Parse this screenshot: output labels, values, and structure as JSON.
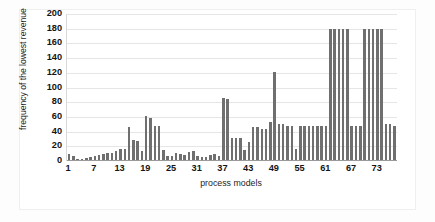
{
  "chart_data": {
    "type": "bar",
    "title": "",
    "xlabel": "process models",
    "ylabel": "frequency of the lowest revenue",
    "ylim": [
      0,
      200
    ],
    "ytick_step": 20,
    "yticks": [
      200,
      180,
      160,
      140,
      120,
      100,
      80,
      60,
      40,
      20,
      0
    ],
    "xticks": [
      1,
      7,
      13,
      19,
      25,
      31,
      37,
      43,
      49,
      55,
      61,
      67,
      73
    ],
    "xlim": [
      1,
      77
    ],
    "grid": true,
    "legend": "none",
    "bar_color": "#6f6f6f",
    "categories": [
      1,
      2,
      3,
      4,
      5,
      6,
      7,
      8,
      9,
      10,
      11,
      12,
      13,
      14,
      15,
      16,
      17,
      18,
      19,
      20,
      21,
      22,
      23,
      24,
      25,
      26,
      27,
      28,
      29,
      30,
      31,
      32,
      33,
      34,
      35,
      36,
      37,
      38,
      39,
      40,
      41,
      42,
      43,
      44,
      45,
      46,
      47,
      48,
      49,
      50,
      51,
      52,
      53,
      54,
      55,
      56,
      57,
      58,
      59,
      60,
      61,
      62,
      63,
      64,
      65,
      66,
      67,
      68,
      69,
      70,
      71,
      72,
      73,
      74,
      75,
      76,
      77
    ],
    "values": [
      8,
      6,
      2,
      2,
      3,
      4,
      6,
      7,
      8,
      9,
      10,
      12,
      15,
      15,
      45,
      28,
      26,
      13,
      60,
      58,
      47,
      47,
      14,
      6,
      5,
      10,
      8,
      7,
      11,
      12,
      5,
      4,
      4,
      7,
      8,
      6,
      85,
      84,
      30,
      30,
      30,
      14,
      24,
      45,
      45,
      43,
      43,
      52,
      120,
      50,
      50,
      46,
      46,
      15,
      46,
      47,
      47,
      47,
      47,
      46,
      46,
      180,
      180,
      180,
      180,
      180,
      46,
      46,
      46,
      180,
      180,
      180,
      180,
      180,
      50,
      50,
      46
    ]
  },
  "axes": {
    "y_title": "frequency of the lowest revenue",
    "x_title": "process models"
  }
}
